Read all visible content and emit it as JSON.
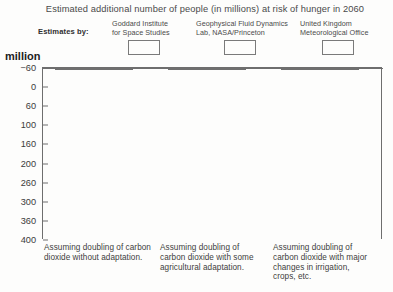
{
  "chart_data": {
    "type": "bar",
    "title": "Estimated additional number of people (in millions) at risk of hunger in 2060",
    "ylabel": "million",
    "xlabel": "",
    "legend_title": "Estimates by:",
    "legend_position": "top",
    "grid": false,
    "ylim": [
      -60,
      400
    ],
    "yticks": [
      -60,
      0,
      60,
      100,
      160,
      200,
      260,
      300,
      360,
      400
    ],
    "ytick_labels": [
      "−60",
      "0",
      "60",
      "100",
      "160",
      "200",
      "260",
      "300",
      "360",
      "400"
    ],
    "categories": [
      "Assuming doubling of carbon\ndioxide without adaptation.",
      "Assuming doubling of\ncarbon dioxide with some\nagricultural adaptation.",
      "Assuming doubling of\ncarbon dioxide with major\nchanges in irrigation,\ncrops, etc."
    ],
    "series": [
      {
        "name": "Goddard Institute\nfor Space Studies",
        "color": "#dcdcdc",
        "values": [
          70,
          55,
          -10
        ]
      },
      {
        "name": "Geophysical Fluid Dynamics\nLab, NASA/Princeton",
        "color": "#6e6e6e",
        "values": [
          110,
          90,
          20
        ]
      },
      {
        "name": "United Kingdom\nMeteorological Office",
        "color": "#a8a8a8",
        "values": [
          375,
          300,
          130
        ]
      }
    ]
  }
}
